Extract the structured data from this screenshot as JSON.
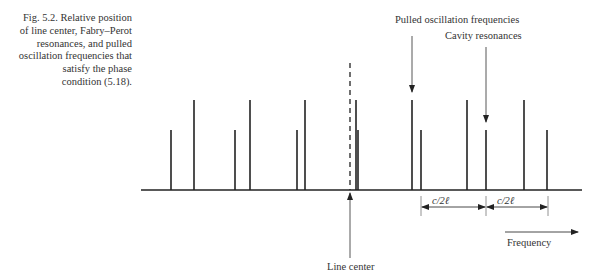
{
  "caption": {
    "lines": [
      "Fig. 5.2.  Relative position",
      "of line center, Fabry–Perot",
      "resonances, and pulled",
      "oscillation frequencies that",
      "satisfy the phase",
      "condition (5.18)."
    ]
  },
  "labels": {
    "pulled": "Pulled oscillation frequencies",
    "cavity": "Cavity resonances",
    "spacing1": "c/2ℓ",
    "spacing2": "c/2ℓ",
    "frequency": "Frequency",
    "line_center": "Line center"
  },
  "diagram": {
    "baseline_y": 190,
    "baseline_x": [
      141,
      582
    ],
    "tall_top_y": 100,
    "short_top_y": 130,
    "tall_lines_x": [
      194,
      250,
      305,
      356,
      412,
      467,
      524
    ],
    "short_lines_x": [
      171,
      235,
      297,
      358,
      421,
      486,
      547
    ],
    "line_center_x": 350,
    "colors": {
      "ink": "#222222"
    }
  }
}
